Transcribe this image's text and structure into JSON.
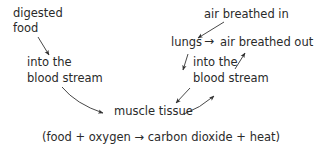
{
  "diagram": {
    "type": "flow",
    "nodes": {
      "digested_food": {
        "line1": "digested",
        "line2": "food"
      },
      "blood_stream_left": {
        "line1": "into the",
        "line2": "blood stream"
      },
      "air_in": {
        "label": "air breathed in"
      },
      "lungs": {
        "label": "lungs"
      },
      "air_out": {
        "label": "air breathed out"
      },
      "blood_stream_right": {
        "line1": "into the",
        "line2": "blood stream"
      },
      "muscle": {
        "label": "muscle tissue"
      }
    },
    "lungs_arrow": "→",
    "equation": "(food + oxygen → carbon dioxide + heat)",
    "edges": [
      {
        "from": "digested food",
        "to": "into the blood stream (left)"
      },
      {
        "from": "into the blood stream (left)",
        "to": "muscle tissue"
      },
      {
        "from": "air breathed in",
        "to": "lungs"
      },
      {
        "from": "lungs",
        "to": "air breathed out"
      },
      {
        "from": "lungs",
        "to": "into the blood stream (right)"
      },
      {
        "from": "into the blood stream (right)",
        "to": "muscle tissue"
      },
      {
        "from": "muscle tissue",
        "to": "into the blood stream (right)"
      },
      {
        "from": "into the blood stream (right)",
        "to": "air breathed out"
      }
    ],
    "colors": {
      "text": "#2a2a2a",
      "arrow": "#333333",
      "background": "#ffffff"
    }
  }
}
